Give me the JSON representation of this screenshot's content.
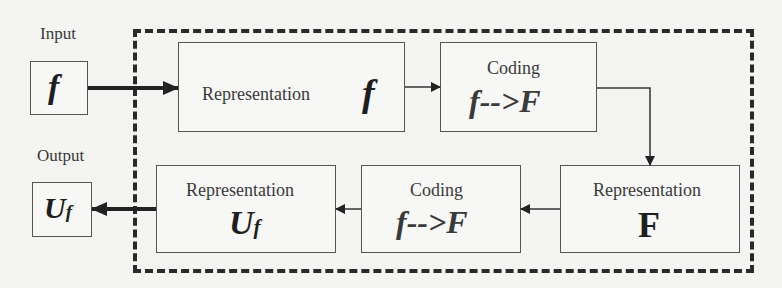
{
  "input": {
    "label": "Input",
    "symbol": "f"
  },
  "output": {
    "label": "Output",
    "symbol_main": "U",
    "symbol_sub": "f"
  },
  "blocks": {
    "rep_f": {
      "title": "Representation",
      "symbol": "f"
    },
    "coding_top": {
      "title": "Coding",
      "expr": "f-->F"
    },
    "rep_F": {
      "title": "Representation",
      "symbol": "F"
    },
    "coding_bottom": {
      "title": "Coding",
      "expr": "f-->F"
    },
    "rep_Uf": {
      "title": "Representation",
      "symbol_main": "U",
      "symbol_sub": "f"
    }
  }
}
